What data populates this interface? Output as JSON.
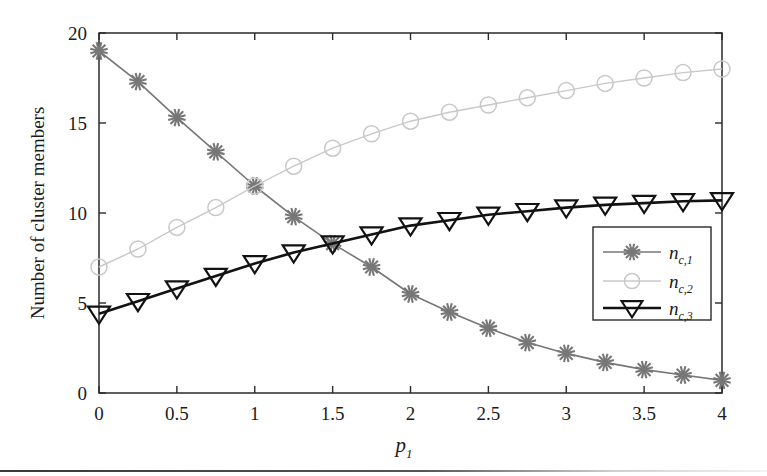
{
  "chart_data": {
    "type": "line",
    "title": "",
    "xlabel": "p_1",
    "xlabel_base": "p",
    "xlabel_sub": "1",
    "ylabel": "Number of cluster members",
    "xlim": [
      0,
      4
    ],
    "ylim": [
      0,
      20
    ],
    "xticks": [
      0,
      0.5,
      1,
      1.5,
      2,
      2.5,
      3,
      3.5,
      4
    ],
    "xticklabels": [
      "0",
      "0.5",
      "1",
      "1.5",
      "2",
      "2.5",
      "3",
      "3.5",
      "4"
    ],
    "yticks": [
      0,
      5,
      10,
      15,
      20
    ],
    "yticklabels": [
      "0",
      "5",
      "10",
      "15",
      "20"
    ],
    "grid": false,
    "legend_position": "lower right",
    "x": [
      0,
      0.25,
      0.5,
      0.75,
      1,
      1.25,
      1.5,
      1.75,
      2,
      2.25,
      2.5,
      2.75,
      3,
      3.25,
      3.5,
      3.75,
      4
    ],
    "series": [
      {
        "name": "n_c,1",
        "label_base": "n",
        "label_sub": "c,1",
        "marker": "asterisk",
        "color": "#777777",
        "line_width": 1.6,
        "values": [
          19.0,
          17.3,
          15.3,
          13.4,
          11.5,
          9.8,
          8.3,
          7.0,
          5.5,
          4.5,
          3.6,
          2.8,
          2.2,
          1.7,
          1.3,
          1.0,
          0.7
        ]
      },
      {
        "name": "n_c,2",
        "label_base": "n",
        "label_sub": "c,2",
        "marker": "circle",
        "color": "#c8c8c8",
        "line_width": 1.4,
        "values": [
          7.0,
          8.0,
          9.2,
          10.3,
          11.5,
          12.6,
          13.6,
          14.4,
          15.1,
          15.6,
          16.0,
          16.4,
          16.8,
          17.2,
          17.5,
          17.8,
          18.0
        ]
      },
      {
        "name": "n_c,3",
        "label_base": "n",
        "label_sub": "c,3",
        "marker": "triangle-down",
        "color": "#121212",
        "line_width": 2.6,
        "values": [
          4.4,
          5.1,
          5.8,
          6.5,
          7.2,
          7.8,
          8.3,
          8.8,
          9.3,
          9.6,
          9.9,
          10.1,
          10.3,
          10.45,
          10.55,
          10.65,
          10.7
        ]
      }
    ]
  },
  "figure": {
    "background_color": "#ffffff",
    "axis_color": "#2a2a2a",
    "legend_border_color": "#2a2a2a",
    "legend_background": "#ffffff"
  }
}
